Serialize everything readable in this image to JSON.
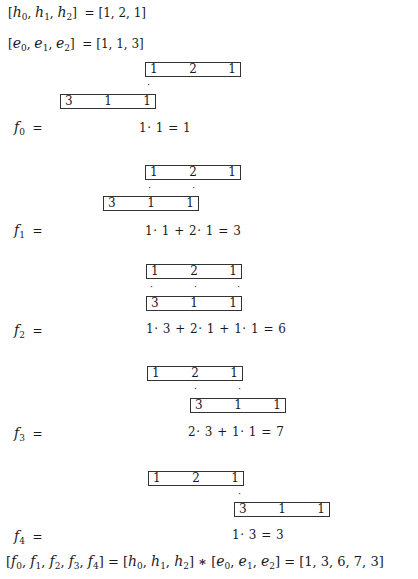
{
  "header": {
    "h_def": {
      "lhs": [
        "h",
        "h",
        "h"
      ],
      "subs": [
        "0",
        "1",
        "2"
      ],
      "rhs": "[1, 2, 1]"
    },
    "e_def": {
      "lhs": [
        "e",
        "e",
        "e"
      ],
      "subs": [
        "0",
        "1",
        "2"
      ],
      "rhs": "[1, 1, 3]"
    }
  },
  "h_values": [
    "1",
    "2",
    "1"
  ],
  "e_reversed": [
    "3",
    "1",
    "1"
  ],
  "steps": [
    {
      "label": "f",
      "sub": "0",
      "eq": "=",
      "expr": "1· 1  =  1"
    },
    {
      "label": "f",
      "sub": "1",
      "eq": "=",
      "expr": "1· 1  +  2· 1   =   3"
    },
    {
      "label": "f",
      "sub": "2",
      "eq": "=",
      "expr": "1· 3  +  2· 1  + 1· 1   =   6"
    },
    {
      "label": "f",
      "sub": "3",
      "eq": "=",
      "expr": "2·  3  + 1· 1   =   7"
    },
    {
      "label": "f",
      "sub": "4",
      "eq": "=",
      "expr": "1· 3   =   3"
    }
  ],
  "dot": "·",
  "footer": {
    "f_list": [
      "0",
      "1",
      "2",
      "3",
      "4"
    ],
    "operator": "∗",
    "result": "[1, 3, 6, 7, 3]"
  }
}
